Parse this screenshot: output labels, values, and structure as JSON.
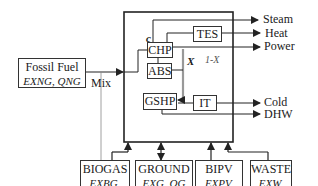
{
  "diagram": {
    "type": "energy-hub-system",
    "colors": {
      "line": "#333333",
      "background": "#ffffff",
      "xbar": "#999999"
    },
    "inputs_left": {
      "fossil_fuel": {
        "title": "Fossil Fuel",
        "vars": "E_XNG, Q_NG",
        "vars_display": "EXNG, QNG"
      },
      "mix_label": "Mix"
    },
    "hub_components": {
      "chp": "CHP",
      "tes": "TES",
      "abs": "ABS",
      "gshp": "GSHP",
      "it": "IT",
      "c_label": "c",
      "x_label": "X",
      "one_minus_x_label": "1-X"
    },
    "outputs": [
      {
        "label": "Steam"
      },
      {
        "label": "Heat"
      },
      {
        "label": "Power"
      },
      {
        "label": "Cold"
      },
      {
        "label": "DHW"
      }
    ],
    "inputs_bottom": [
      {
        "title": "BIOGAS",
        "vars_display": "EXBG, QBG",
        "vars": "E_XBG, Q_BG"
      },
      {
        "title": "GROUND",
        "vars_display": "EXG, QG",
        "vars": "E_XG, Q_G"
      },
      {
        "title": "BIPV",
        "vars_display": "EXPV, QPV",
        "vars": "E_XPV, Q_PV"
      },
      {
        "title": "WASTE",
        "vars_display": "EXW, QW",
        "vars": "E_XW, Q_W"
      }
    ]
  }
}
